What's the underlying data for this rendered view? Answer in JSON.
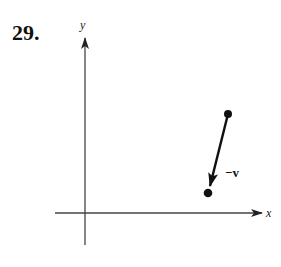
{
  "problem_number": "29.",
  "axes": {
    "x_label": "x",
    "y_label": "y"
  },
  "vector": {
    "label": "−v",
    "start": [
      228,
      114
    ],
    "end": [
      208,
      193
    ]
  },
  "colors": {
    "ink": "#111111",
    "axis": "#444444"
  }
}
